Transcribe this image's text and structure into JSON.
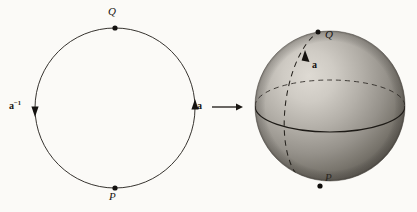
{
  "figure": {
    "background_color": "#fbfaf7",
    "ink_color": "#1a1713"
  },
  "circle_diagram": {
    "name": "circle-with-basepoints",
    "center": {
      "x": 115,
      "y": 108
    },
    "radius": 80,
    "points": [
      {
        "id": "Q",
        "label": "Q",
        "position": "top",
        "x": 115,
        "y": 28
      },
      {
        "id": "P",
        "label": "P",
        "position": "bottom",
        "x": 115,
        "y": 188
      }
    ],
    "arrows": [
      {
        "id": "a",
        "label": "a",
        "superscript": "",
        "side": "right",
        "direction": "up",
        "x": 195,
        "y": 108
      },
      {
        "id": "a-inverse",
        "label": "a",
        "superscript": "−1",
        "side": "left",
        "direction": "down",
        "x": 35,
        "y": 108
      }
    ]
  },
  "map_arrow": {
    "name": "maps-to-arrow",
    "from_x": 212,
    "to_x": 243,
    "y": 107
  },
  "sphere_diagram": {
    "name": "shaded-sphere",
    "center": {
      "x": 330,
      "y": 106
    },
    "radius": 75,
    "highlight_color": "#d8d4cd",
    "shadow_color": "#55514b",
    "points": [
      {
        "id": "Q",
        "label": "Q",
        "x": 318,
        "y": 32
      },
      {
        "id": "P",
        "label": "P",
        "x": 320,
        "y": 186
      }
    ],
    "curves": [
      {
        "id": "equator-front",
        "style": "solid",
        "description": "front half of equator"
      },
      {
        "id": "equator-back",
        "style": "dashed",
        "description": "back half of equator"
      },
      {
        "id": "meridian",
        "style": "dashed",
        "description": "meridian arc from P to Q"
      }
    ],
    "arrows": [
      {
        "id": "a",
        "label": "a",
        "on_curve": "meridian",
        "direction": "up",
        "x": 306,
        "y": 62
      }
    ]
  }
}
